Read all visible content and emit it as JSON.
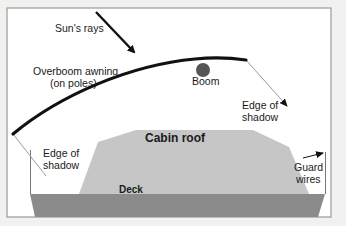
{
  "diagram": {
    "colors": {
      "background": "#f1f1f0",
      "frame_fill": "#ffffff",
      "frame_stroke": "#9a9a9a",
      "deck": "#8b8b8b",
      "cabin_roof": "#c6c6c6",
      "awning": "#111111",
      "boom": "#555555",
      "shadow_line": "#9a9a9a",
      "arrow": "#111111"
    },
    "labels": {
      "sun_rays": "Sun's rays",
      "awning_line1": "Overboom awning",
      "awning_line2": "(on poles)",
      "boom": "Boom",
      "shadow_right_line1": "Edge of",
      "shadow_right_line2": "shadow",
      "shadow_left_line1": "Edge of",
      "shadow_left_line2": "shadow",
      "cabin_roof": "Cabin roof",
      "deck": "Deck",
      "guard_wires_line1": "Guard",
      "guard_wires_line2": "wires"
    }
  }
}
